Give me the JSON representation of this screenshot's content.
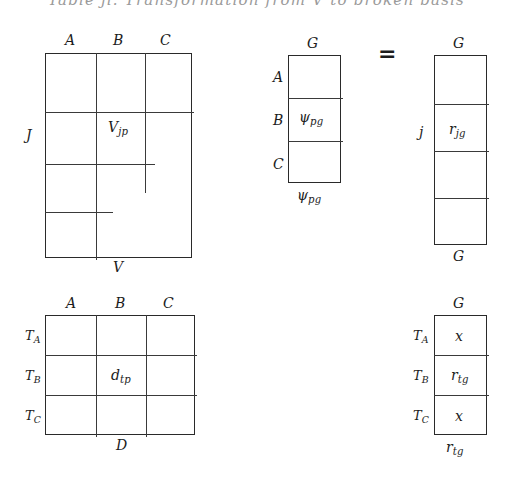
{
  "figure": {
    "caption_top": "Table ji. Transformation from V to broken basis",
    "equals_sign": "=",
    "background_color": "#ffffff",
    "ink_color": "#1c1c1c"
  },
  "matrices": [
    {
      "id": "matrix-v",
      "name": "v-matrix",
      "top_labels": [
        "A",
        "B",
        "C"
      ],
      "left_label": "J",
      "bottom_label": "V",
      "cell_label": "V",
      "cell_sub": "jp",
      "columns": 3,
      "rows": 4
    },
    {
      "id": "matrix-psi",
      "name": "psi-matrix",
      "top_label": "G",
      "row_labels": [
        "A",
        "B",
        "C"
      ],
      "bottom_label": "ψ",
      "bottom_sub": "pg",
      "cell_label": "ψ",
      "cell_sub": "pg",
      "rows": 3
    },
    {
      "id": "matrix-r-jg",
      "name": "r-jg-matrix",
      "top_label": "G",
      "left_label": "j",
      "bottom_label": "G",
      "cell_label": "r",
      "cell_sub": "jg",
      "rows": 4
    },
    {
      "id": "matrix-d",
      "name": "d-matrix",
      "top_labels": [
        "A",
        "B",
        "C"
      ],
      "row_labels": [
        {
          "base": "T",
          "sub": "A"
        },
        {
          "base": "T",
          "sub": "B"
        },
        {
          "base": "T",
          "sub": "C"
        }
      ],
      "bottom_label": "D",
      "cell_label": "d",
      "cell_sub": "tp",
      "columns": 3,
      "rows": 3
    },
    {
      "id": "matrix-r-tg",
      "name": "r-tg-matrix",
      "top_label": "G",
      "row_labels": [
        {
          "base": "T",
          "sub": "A"
        },
        {
          "base": "T",
          "sub": "B"
        },
        {
          "base": "T",
          "sub": "C"
        }
      ],
      "bottom_label": "r",
      "bottom_sub": "tg",
      "cells": [
        {
          "base": "x",
          "sub": ""
        },
        {
          "base": "r",
          "sub": "tg"
        },
        {
          "base": "x",
          "sub": ""
        }
      ],
      "rows": 3
    }
  ]
}
